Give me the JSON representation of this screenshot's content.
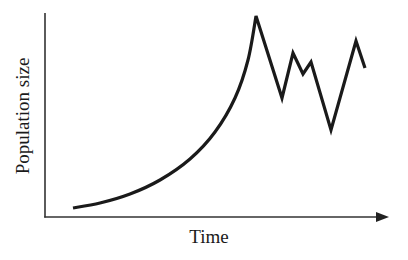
{
  "chart_data": {
    "type": "line",
    "title": "",
    "xlabel": "Time",
    "ylabel": "Population size",
    "grid": false,
    "legend": null,
    "x_ticks": [],
    "y_ticks": [],
    "series": [
      {
        "name": "population",
        "color": "#1a1a1a",
        "points_px": [
          [
            73,
            208
          ],
          [
            100,
            203
          ],
          [
            130,
            194
          ],
          [
            160,
            180
          ],
          [
            190,
            159
          ],
          [
            215,
            132
          ],
          [
            235,
            98
          ],
          [
            248,
            60
          ],
          [
            256,
            16
          ],
          [
            282,
            98
          ],
          [
            293,
            53
          ],
          [
            303,
            74
          ],
          [
            311,
            62
          ],
          [
            331,
            130
          ],
          [
            356,
            41
          ],
          [
            365,
            68
          ]
        ],
        "values_relative": [
          {
            "x": 0.0,
            "y": 0.05
          },
          {
            "x": 0.09,
            "y": 0.07
          },
          {
            "x": 0.19,
            "y": 0.12
          },
          {
            "x": 0.3,
            "y": 0.19
          },
          {
            "x": 0.4,
            "y": 0.29
          },
          {
            "x": 0.49,
            "y": 0.42
          },
          {
            "x": 0.56,
            "y": 0.58
          },
          {
            "x": 0.6,
            "y": 0.77
          },
          {
            "x": 0.63,
            "y": 0.99
          },
          {
            "x": 0.72,
            "y": 0.58
          },
          {
            "x": 0.76,
            "y": 0.81
          },
          {
            "x": 0.79,
            "y": 0.7
          },
          {
            "x": 0.82,
            "y": 0.76
          },
          {
            "x": 0.89,
            "y": 0.43
          },
          {
            "x": 0.98,
            "y": 0.87
          },
          {
            "x": 1.0,
            "y": 0.74
          }
        ]
      }
    ]
  },
  "labels": {
    "x_axis": "Time",
    "y_axis": "Population size"
  }
}
